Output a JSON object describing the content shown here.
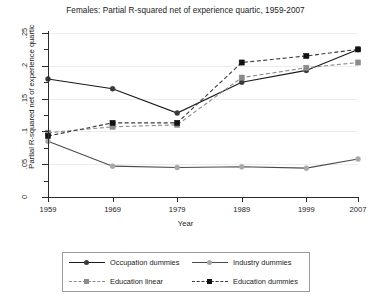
{
  "chart_data": {
    "type": "line",
    "title": "Females: Partial R-squared net of experience quartic, 1959-2007",
    "xlabel": "Year",
    "ylabel": "Partial R-squared net of experience quartic",
    "x": [
      1959,
      1969,
      1979,
      1989,
      1999,
      2007
    ],
    "xtick_labels": [
      "1959",
      "1969",
      "1979",
      "1989",
      "1999",
      "2007"
    ],
    "ytick_labels": [
      "0",
      ".05",
      ".1",
      ".15",
      ".2",
      ".25"
    ],
    "ytick_values": [
      0,
      0.05,
      0.1,
      0.15,
      0.2,
      0.25
    ],
    "ylim": [
      0,
      0.25
    ],
    "xlim": [
      1959,
      2007
    ],
    "grid": true,
    "legend_position": "bottom",
    "series": [
      {
        "name": "Occupation dummies",
        "values": [
          0.18,
          0.165,
          0.128,
          0.175,
          0.193,
          0.225
        ],
        "color": "#1a1a1a",
        "line_style": "solid",
        "marker": "circle",
        "marker_color": "#3a3a3a"
      },
      {
        "name": "Industry dummies",
        "values": [
          0.085,
          0.047,
          0.045,
          0.046,
          0.044,
          0.058
        ],
        "color": "#4a4a4a",
        "line_style": "solid",
        "marker": "circle",
        "marker_color": "#a8a8a8"
      },
      {
        "name": "Education linear",
        "values": [
          0.098,
          0.107,
          0.11,
          0.182,
          0.197,
          0.205
        ],
        "color": "#8c8c8c",
        "line_style": "dashed",
        "marker": "square",
        "marker_color": "#8c8c8c"
      },
      {
        "name": "Education dummies",
        "values": [
          0.093,
          0.113,
          0.113,
          0.205,
          0.215,
          0.225
        ],
        "color": "#3a3a3a",
        "line_style": "dashed",
        "marker": "square",
        "marker_color": "#111111"
      }
    ]
  }
}
